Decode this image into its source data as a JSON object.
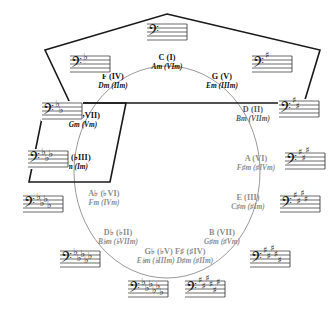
{
  "diagram": {
    "type": "circle-of-fifths",
    "colors": {
      "ink": "#111111",
      "faded": "#8d8d8d",
      "mid": "#5a5a5a",
      "circle_stroke": "#9a9a9a",
      "shape_stroke": "#1a1a1a",
      "background": "#ffffff"
    },
    "circle": {
      "cx": 167,
      "cy": 172,
      "rx": 93,
      "ry": 106
    },
    "pentagon": {
      "name": "pentagon-highlight",
      "points": "167,14 320,50 304,103 70,103 45,50",
      "stroke_width": 1.6
    },
    "parallelogram": {
      "name": "parallelogram-highlight",
      "points": "45,103 126,103 110,182 29,182",
      "stroke_width": 1.6
    }
  },
  "keys": [
    {
      "id": "c",
      "major": "C (I)",
      "minor": "Am (VIm)",
      "x": 167,
      "y": 62,
      "tone": "dark"
    },
    {
      "id": "g",
      "major": "G (V)",
      "minor": "Em (IIIm)",
      "x": 222,
      "y": 81,
      "tone": "dark"
    },
    {
      "id": "d",
      "major": "D (II)",
      "minor": "Bm (VIIm)",
      "x": 253,
      "y": 114,
      "tone": "mid"
    },
    {
      "id": "a",
      "major": "A (VI)",
      "minor": "F♯m (♯IVm)",
      "x": 256,
      "y": 163,
      "tone": "dim"
    },
    {
      "id": "e",
      "major": "E (III)",
      "minor": "C♯m (♯Im)",
      "x": 248,
      "y": 202,
      "tone": "dim"
    },
    {
      "id": "b",
      "major": "B (VII)",
      "minor": "G♯m (♯Vm)",
      "x": 222,
      "y": 237,
      "tone": "dim"
    },
    {
      "id": "gb-fs",
      "major": "G♭ (♭V) F♯ (♯IV)",
      "minor": "E♭m (♭IIIm) D♯m (♯IIm)",
      "x": 175,
      "y": 256,
      "tone": "dim"
    },
    {
      "id": "db",
      "major": "D♭ (♭II)",
      "minor": "B♭m (♭VIIm)",
      "x": 118,
      "y": 237,
      "tone": "dim"
    },
    {
      "id": "ab",
      "major": "A♭ (♭VI)",
      "minor": "Fm (IVm)",
      "x": 104,
      "y": 198,
      "tone": "dim"
    },
    {
      "id": "eb",
      "major": "E♭ (♭III)",
      "minor": "Cm (Im)",
      "x": 75,
      "y": 162,
      "tone": "dark"
    },
    {
      "id": "bb",
      "major": "B♭ (♭VII)",
      "minor": "Gm (Vm)",
      "x": 83,
      "y": 120,
      "tone": "dark"
    },
    {
      "id": "f",
      "major": "F (IV)",
      "minor": "Dm (IIm)",
      "x": 113,
      "y": 81,
      "tone": "dark"
    }
  ],
  "staves": [
    {
      "id": "staff-c",
      "for": "C",
      "clef": "bass",
      "accidental": "none",
      "count": 0,
      "x": 167,
      "y": 33,
      "scale": 1.0
    },
    {
      "id": "staff-f",
      "for": "F",
      "clef": "bass",
      "accidental": "flat",
      "count": 1,
      "x": 90,
      "y": 65,
      "scale": 1.0
    },
    {
      "id": "staff-g",
      "for": "G",
      "clef": "bass",
      "accidental": "sharp",
      "count": 1,
      "x": 272,
      "y": 65,
      "scale": 1.0
    },
    {
      "id": "staff-bb",
      "for": "Bb",
      "clef": "bass",
      "accidental": "flat",
      "count": 2,
      "x": 62,
      "y": 112,
      "scale": 1.0
    },
    {
      "id": "staff-d",
      "for": "D",
      "clef": "bass",
      "accidental": "sharp",
      "count": 2,
      "x": 299,
      "y": 110,
      "scale": 1.0
    },
    {
      "id": "staff-eb",
      "for": "Eb",
      "clef": "bass",
      "accidental": "flat",
      "count": 3,
      "x": 48,
      "y": 160,
      "scale": 1.0
    },
    {
      "id": "staff-a",
      "for": "A",
      "clef": "bass",
      "accidental": "sharp",
      "count": 3,
      "x": 305,
      "y": 162,
      "scale": 1.0
    },
    {
      "id": "staff-ab",
      "for": "Ab",
      "clef": "bass",
      "accidental": "flat",
      "count": 4,
      "x": 43,
      "y": 205,
      "scale": 1.0
    },
    {
      "id": "staff-e",
      "for": "E",
      "clef": "bass",
      "accidental": "sharp",
      "count": 4,
      "x": 300,
      "y": 205,
      "scale": 1.0
    },
    {
      "id": "staff-db",
      "for": "Db",
      "clef": "bass",
      "accidental": "flat",
      "count": 5,
      "x": 80,
      "y": 260,
      "scale": 1.0
    },
    {
      "id": "staff-b",
      "for": "B",
      "clef": "bass",
      "accidental": "sharp",
      "count": 5,
      "x": 270,
      "y": 260,
      "scale": 1.0
    },
    {
      "id": "staff-gb",
      "for": "Gb",
      "clef": "bass",
      "accidental": "flat",
      "count": 6,
      "x": 148,
      "y": 290,
      "scale": 1.0
    },
    {
      "id": "staff-fs",
      "for": "F#",
      "clef": "bass",
      "accidental": "sharp",
      "count": 6,
      "x": 205,
      "y": 290,
      "scale": 1.0
    }
  ]
}
